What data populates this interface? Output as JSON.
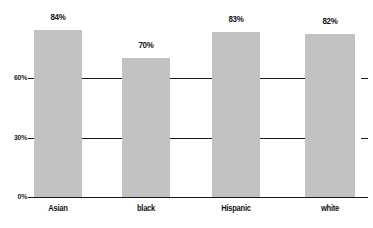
{
  "chart_data": {
    "type": "bar",
    "title": "",
    "subtitle": "",
    "xlabel": "",
    "ylabel": "",
    "categories": [
      "Asian",
      "black",
      "Hispanic",
      "white"
    ],
    "values": [
      84,
      70,
      83,
      82
    ],
    "value_labels": [
      "84%",
      "70%",
      "83%",
      "82%"
    ],
    "ylim": [
      0,
      90
    ],
    "yticks": [
      0,
      30,
      60
    ],
    "ytick_labels": [
      "0%",
      "30%",
      "60%"
    ],
    "grid": true,
    "grid_axis": "y",
    "legend": null,
    "legend_position": "none",
    "series": [
      {
        "name": "",
        "values": [
          84,
          70,
          83,
          82
        ]
      }
    ],
    "annotations": [],
    "colors": {
      "bar_fill": "#c2c2c2",
      "axis": "#1a1a1a",
      "grid": "#1a1a1a",
      "text": "#141414",
      "background": "#ffffff"
    }
  }
}
